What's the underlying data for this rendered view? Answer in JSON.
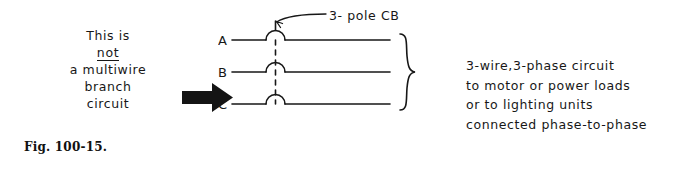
{
  "figure": {
    "caption": "Fig. 100-15.",
    "left_note": {
      "line1": "This is",
      "line2_underlined": "not",
      "line3": "a multiwire",
      "line4": "branch",
      "line5": "circuit"
    },
    "arrow": {
      "name": "right-pointing-arrow",
      "direction": "right",
      "color": "#141414"
    },
    "breaker": {
      "label": "3- pole CB",
      "leader_line": true,
      "poles": 3,
      "tie_bar_style": "dashed-vertical"
    },
    "phases": [
      {
        "label": "A"
      },
      {
        "label": "B"
      },
      {
        "label": "C"
      }
    ],
    "brace": {
      "name": "right-curly-brace",
      "orientation": "left-facing"
    },
    "right_note": {
      "line1": "3-wire,3-phase circuit",
      "line2": "to motor or power loads",
      "line3": "or to lighting units",
      "line4": "connected phase-to-phase"
    },
    "colors": {
      "ink": "#171717",
      "background": "#ffffff"
    }
  }
}
